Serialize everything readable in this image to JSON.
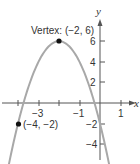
{
  "chart_data": {
    "type": "line",
    "title": "",
    "equation": "y = -2(x + 2)^2 + 6",
    "xlabel": "x",
    "ylabel": "y",
    "xlim": [
      -4.9,
      1.7
    ],
    "ylim": [
      -4.5,
      9.5
    ],
    "x_ticks": [
      -4,
      -3,
      -2,
      -1,
      1
    ],
    "x_tick_labels": [
      "-3",
      "-1",
      "1"
    ],
    "y_ticks": [
      -4,
      -2,
      2,
      4,
      6
    ],
    "y_tick_labels": [
      "-4",
      "-2",
      "2",
      "4",
      "6"
    ],
    "grid": false,
    "series": [
      {
        "name": "parabola",
        "color": "#a8a8a8"
      }
    ],
    "points": [
      {
        "x": -2,
        "y": 6,
        "label": "Vertex: (−2, 6)"
      },
      {
        "x": -4,
        "y": -2,
        "label": "(−4, −2)"
      }
    ]
  },
  "labels": {
    "x_axis": "x",
    "y_axis": "y",
    "xt_m3": "−3",
    "xt_m1": "−1",
    "xt_1": "1",
    "yt_6": "6",
    "yt_4": "4",
    "yt_2": "2",
    "yt_m2": "−2",
    "yt_m4": "−4",
    "vertex": "Vertex: (−2, 6)",
    "point": "(−4, −2)"
  }
}
